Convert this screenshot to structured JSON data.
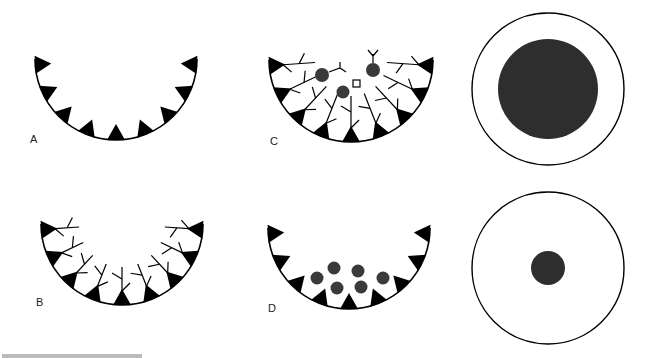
{
  "figure": {
    "panels": [
      {
        "id": "A",
        "label": "A",
        "cx": 116,
        "cy": 59,
        "r": 81,
        "label_x": 30,
        "label_y": 143,
        "processes": "none",
        "dots": []
      },
      {
        "id": "B",
        "label": "B",
        "cx": 122,
        "cy": 224,
        "r": 81,
        "label_x": 36,
        "label_y": 306,
        "processes": "short",
        "dots": []
      },
      {
        "id": "C",
        "label": "C",
        "cx": 351,
        "cy": 60,
        "r": 82,
        "label_x": 270,
        "label_y": 145,
        "processes": "long",
        "dots": [
          {
            "x": 322,
            "y": 75,
            "r": 7
          },
          {
            "x": 343,
            "y": 92,
            "r": 6.5
          },
          {
            "x": 373,
            "y": 70,
            "r": 7
          }
        ]
      },
      {
        "id": "D",
        "label": "D",
        "cx": 349,
        "cy": 228,
        "r": 81,
        "label_x": 268,
        "label_y": 312,
        "processes": "none",
        "dots": [
          {
            "x": 317,
            "y": 278,
            "r": 6.5
          },
          {
            "x": 334,
            "y": 268,
            "r": 6.5
          },
          {
            "x": 358,
            "y": 271,
            "r": 6.5
          },
          {
            "x": 383,
            "y": 278,
            "r": 6.5
          },
          {
            "x": 337,
            "y": 288,
            "r": 6.5
          },
          {
            "x": 361,
            "y": 287,
            "r": 6.5
          }
        ]
      }
    ],
    "circles": [
      {
        "id": "large-core",
        "cx": 548,
        "cy": 89,
        "outer_r": 76,
        "inner_r": 50
      },
      {
        "id": "small-core",
        "cx": 548,
        "cy": 268,
        "outer_r": 76,
        "inner_r": 17
      }
    ],
    "teeth_count": 9,
    "colors": {
      "ink": "#000000",
      "dot": "#3a3a3a",
      "core": "#2e2e2e"
    }
  }
}
